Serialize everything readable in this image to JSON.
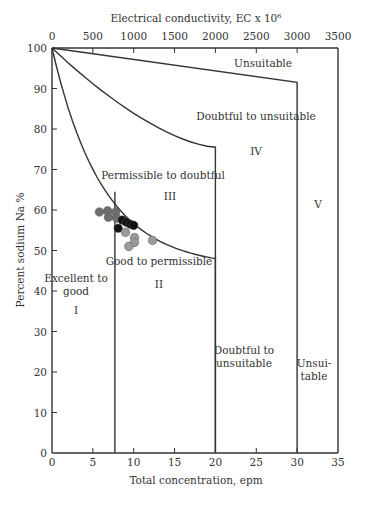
{
  "chart_data": {
    "type": "scatter",
    "title": "",
    "xlabel": "Total concentration, epm",
    "ylabel": "Percent sodium Na %",
    "x2label": "Electrical conductivity, EC x 10⁶",
    "xlim": [
      0,
      35
    ],
    "ylim": [
      0,
      100
    ],
    "x2lim": [
      0,
      3500
    ],
    "x_ticks": [
      "0",
      "5",
      "10",
      "15",
      "20",
      "25",
      "30",
      "35"
    ],
    "y_ticks": [
      "0",
      "10",
      "20",
      "30",
      "40",
      "50",
      "60",
      "70",
      "80",
      "90",
      "100"
    ],
    "x2_ticks": [
      "0",
      "500",
      "1000",
      "1500",
      "2000",
      "2500",
      "3000",
      "3500"
    ],
    "grid": false,
    "zones": [
      {
        "roman": "I",
        "label": "Excellent to good"
      },
      {
        "roman": "II",
        "label": "Good to permissible"
      },
      {
        "roman": "III",
        "label": "Permissible to doubtful"
      },
      {
        "roman": "IV",
        "label": "Doubtful to unsuitable"
      },
      {
        "roman": "V",
        "label": "Unsuitable"
      }
    ],
    "boundary_labels": {
      "top_unsuitable": "Unsuitable",
      "top_doubtful": "Doubtful to unsuitable",
      "permissible": "Permissible to doubtful",
      "good": "Good to permissible",
      "excellent_line1": "Excellent to",
      "excellent_line2": "good",
      "bottom_doubtful_line1": "Doubtful to",
      "bottom_doubtful_line2": "unsuitable",
      "bottom_unsuit_line1": "Unsui-",
      "bottom_unsuit_line2": "table"
    },
    "series": [
      {
        "name": "dark gray samples",
        "color": "#6e6e6e",
        "points": [
          [
            5.8,
            59.5
          ],
          [
            6.8,
            59.8
          ],
          [
            6.9,
            58.2
          ],
          [
            7.8,
            59.5
          ],
          [
            7.9,
            58.0
          ]
        ]
      },
      {
        "name": "black samples",
        "color": "#111111",
        "points": [
          [
            8.6,
            57.5
          ],
          [
            9.1,
            57.0
          ],
          [
            9.6,
            56.5
          ],
          [
            10.0,
            56.2
          ],
          [
            8.1,
            55.5
          ]
        ]
      },
      {
        "name": "light gray samples",
        "color": "#9a9a9a",
        "points": [
          [
            9.0,
            54.5
          ],
          [
            10.1,
            53.2
          ],
          [
            10.1,
            52.0
          ],
          [
            12.3,
            52.5
          ],
          [
            9.4,
            51.0
          ]
        ]
      }
    ],
    "boundaries": {
      "unsuitable_line": [
        [
          0,
          100
        ],
        [
          30,
          91.5
        ],
        [
          30,
          0
        ]
      ],
      "doubtful_line": [
        [
          0,
          100
        ],
        [
          20,
          75.5
        ],
        [
          20,
          0
        ]
      ],
      "permissible_curve": [
        [
          0,
          100
        ],
        [
          2,
          87
        ],
        [
          4,
          77
        ],
        [
          6,
          69.5
        ],
        [
          7.7,
          64.5
        ],
        [
          10,
          60
        ],
        [
          14,
          54
        ],
        [
          20,
          48
        ],
        [
          20,
          0
        ]
      ],
      "excellent_line": [
        [
          7.7,
          64.5
        ],
        [
          7.7,
          0
        ]
      ]
    }
  }
}
